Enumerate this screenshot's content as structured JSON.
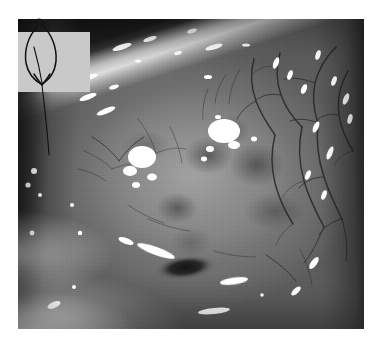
{
  "page": {
    "background_color": "#ffffff",
    "width": 379,
    "height": 345,
    "kind": "clinical-photograph-figure",
    "caption": ""
  },
  "photograph": {
    "name": "clinical-photograph",
    "description": "Grayscale close-up surgical photograph of an anterior ocular surface showing a pale raised conjunctival/scleral mass with surrounding dilated feeder vessels",
    "rendering": "grayscale",
    "frame": {
      "left": 18,
      "top": 19,
      "width": 346,
      "height": 310
    },
    "tones": {
      "darkest": "#1a1a1a",
      "shadow": "#3c3c3c",
      "mid": "#6e6e6e",
      "tissue": "#8d8d8d",
      "pale": "#c9c9c9",
      "specular": "#ffffff"
    },
    "regions": [
      {
        "id": "upper-lid-band",
        "label": "dark diagonal upper lid / shadow band",
        "position": "top-left to top-centre"
      },
      {
        "id": "lid-margin-streak",
        "label": "bright lid margin light streak",
        "position": "upper diagonal"
      },
      {
        "id": "central-mass",
        "label": "pale globular central mass with mottled dark lobules",
        "position": "centre"
      },
      {
        "id": "vessel-arborisation",
        "label": "branching dilated conjunctival vessels",
        "position": "right"
      },
      {
        "id": "pigmented-lesion",
        "label": "dark pigmented focus",
        "position": "lower centre"
      },
      {
        "id": "lower-lid",
        "label": "pale lower lid / retractor",
        "position": "bottom-left"
      }
    ],
    "specular_highlights_count": 34
  },
  "annotation": {
    "name": "hand-drawn-arrow-annotation",
    "type": "ink-overlay",
    "ink_color": "#111111",
    "patch_color": "#c9c9c9",
    "patch": {
      "left": 18,
      "top": 32,
      "width": 72,
      "height": 60
    },
    "description": "Hand-drawn elongated loop terminating in an arrowhead, with a long tail stroke running down and to the right onto the tissue",
    "text": ""
  }
}
